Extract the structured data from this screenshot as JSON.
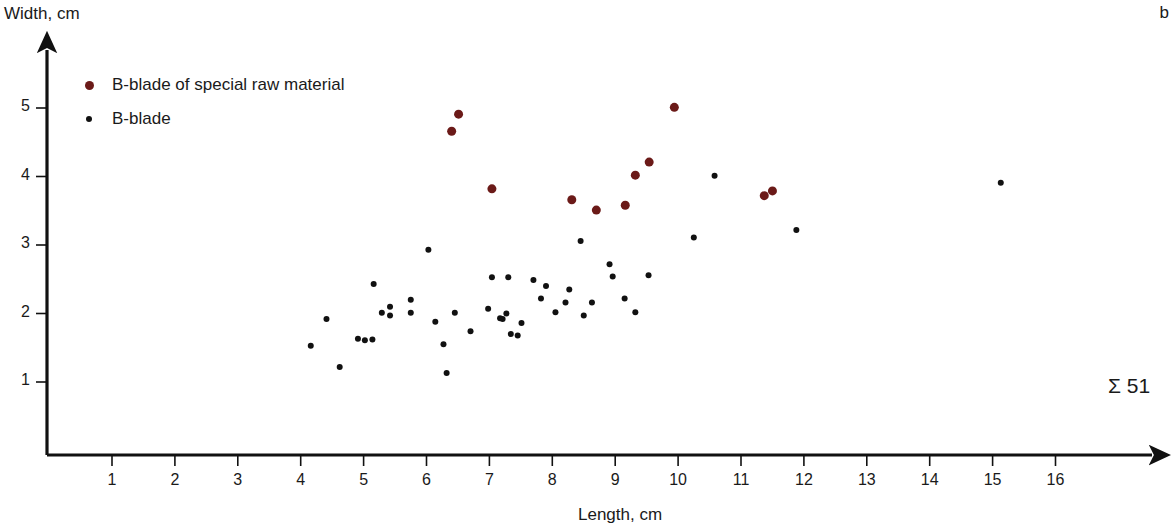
{
  "panel": {
    "letter": "b",
    "sum_annotation": "Σ 51"
  },
  "legend": {
    "items": [
      {
        "label": "B-blade of special raw material",
        "marker": "large-dot",
        "color": "#6b1a18"
      },
      {
        "label": "B-blade",
        "marker": "small-dot",
        "color": "#111111"
      }
    ]
  },
  "axes": {
    "x_title": "Length, cm",
    "y_title": "Width, cm",
    "x_ticks": [
      "1",
      "2",
      "3",
      "4",
      "5",
      "6",
      "7",
      "8",
      "9",
      "10",
      "11",
      "12",
      "13",
      "14",
      "15",
      "16"
    ],
    "y_ticks": [
      "1",
      "2",
      "3",
      "4",
      "5"
    ]
  },
  "chart_data": {
    "type": "scatter",
    "title": "",
    "xlabel": "Length, cm",
    "ylabel": "Width, cm",
    "xlim": [
      0.3,
      16.9
    ],
    "ylim": [
      0.35,
      5.5
    ],
    "grid": false,
    "legend_position": "top-left",
    "annotations": [
      {
        "text": "Σ 51",
        "x": 16.0,
        "y": 1.15
      },
      {
        "text": "b",
        "x": 16.8,
        "y": 5.45
      }
    ],
    "series": [
      {
        "name": "B-blade of special raw material",
        "color": "#6b1a18",
        "marker_size": 9,
        "points": [
          [
            6.51,
            4.91
          ],
          [
            6.4,
            4.66
          ],
          [
            7.04,
            3.82
          ],
          [
            8.31,
            3.66
          ],
          [
            8.7,
            3.51
          ],
          [
            9.16,
            3.58
          ],
          [
            9.32,
            4.02
          ],
          [
            9.54,
            4.21
          ],
          [
            9.94,
            5.01
          ],
          [
            11.37,
            3.72
          ],
          [
            11.5,
            3.79
          ]
        ]
      },
      {
        "name": "B-blade",
        "color": "#111111",
        "marker_size": 6,
        "points": [
          [
            4.16,
            1.53
          ],
          [
            4.41,
            1.92
          ],
          [
            4.62,
            1.22
          ],
          [
            4.91,
            1.63
          ],
          [
            5.02,
            1.61
          ],
          [
            5.14,
            1.62
          ],
          [
            5.16,
            2.43
          ],
          [
            5.29,
            2.01
          ],
          [
            5.42,
            1.97
          ],
          [
            5.42,
            2.1
          ],
          [
            5.75,
            2.01
          ],
          [
            5.75,
            2.2
          ],
          [
            6.03,
            2.93
          ],
          [
            6.14,
            1.88
          ],
          [
            6.27,
            1.55
          ],
          [
            6.32,
            1.13
          ],
          [
            6.45,
            2.01
          ],
          [
            6.7,
            1.74
          ],
          [
            6.98,
            2.07
          ],
          [
            7.04,
            2.53
          ],
          [
            7.17,
            1.93
          ],
          [
            7.21,
            1.92
          ],
          [
            7.27,
            2.0
          ],
          [
            7.3,
            2.53
          ],
          [
            7.34,
            1.7
          ],
          [
            7.45,
            1.68
          ],
          [
            7.51,
            1.86
          ],
          [
            7.7,
            2.49
          ],
          [
            7.82,
            2.22
          ],
          [
            7.9,
            2.4
          ],
          [
            8.05,
            2.02
          ],
          [
            8.21,
            2.16
          ],
          [
            8.27,
            2.35
          ],
          [
            8.45,
            3.06
          ],
          [
            8.5,
            1.97
          ],
          [
            8.63,
            2.16
          ],
          [
            8.91,
            2.72
          ],
          [
            8.96,
            2.54
          ],
          [
            9.15,
            2.22
          ],
          [
            9.32,
            2.02
          ],
          [
            9.53,
            2.56
          ],
          [
            10.25,
            3.11
          ],
          [
            10.58,
            4.01
          ],
          [
            11.88,
            3.22
          ],
          [
            15.13,
            3.91
          ]
        ]
      }
    ]
  }
}
